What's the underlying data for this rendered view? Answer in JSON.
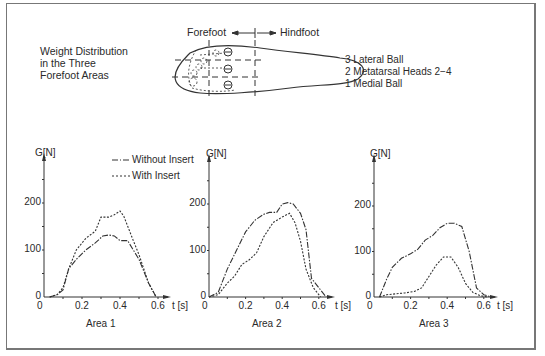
{
  "figure": {
    "title_lines": [
      "Weight Distribution",
      "in the Three",
      "Forefoot Areas"
    ],
    "forefoot_label": "Forefoot",
    "hindfoot_label": "Hindfoot",
    "areas_legend": [
      "3 Lateral Ball",
      "2 Metatarsal Heads 2−4",
      "1 Medial Ball"
    ],
    "series_legend": {
      "without": "Without Insert",
      "with": "With Insert"
    }
  },
  "chart_data": [
    {
      "type": "line",
      "title": "Area 1",
      "xlabel": "t [s]",
      "ylabel": "G[N]",
      "x_ticks": [
        "0",
        "0.2",
        "0.4",
        "0.6"
      ],
      "y_ticks": [
        "0",
        "100",
        "200"
      ],
      "xlim": [
        0,
        0.65
      ],
      "ylim": [
        0,
        280
      ],
      "series": [
        {
          "name": "Without Insert",
          "style": "dash-dot",
          "x": [
            0.03,
            0.07,
            0.1,
            0.13,
            0.17,
            0.22,
            0.27,
            0.31,
            0.34,
            0.37,
            0.4,
            0.44,
            0.47,
            0.5,
            0.55,
            0.59
          ],
          "y": [
            0,
            5,
            15,
            60,
            80,
            100,
            115,
            130,
            132,
            130,
            120,
            120,
            100,
            80,
            30,
            0
          ]
        },
        {
          "name": "With Insert",
          "style": "dashed",
          "x": [
            0.03,
            0.07,
            0.1,
            0.13,
            0.17,
            0.22,
            0.27,
            0.3,
            0.34,
            0.37,
            0.4,
            0.42,
            0.47,
            0.5,
            0.55,
            0.59
          ],
          "y": [
            0,
            5,
            20,
            60,
            100,
            125,
            140,
            170,
            170,
            175,
            183,
            172,
            120,
            90,
            30,
            0
          ]
        }
      ]
    },
    {
      "type": "line",
      "title": "Area 2",
      "xlabel": "t [s]",
      "ylabel": "G[N]",
      "x_ticks": [
        "0",
        "0.2",
        "0.4",
        "0.6"
      ],
      "y_ticks": [
        "0",
        "100",
        "200"
      ],
      "xlim": [
        0,
        0.7
      ],
      "ylim": [
        0,
        280
      ],
      "series": [
        {
          "name": "Without Insert",
          "style": "dash-dot",
          "x": [
            0,
            0.05,
            0.1,
            0.15,
            0.2,
            0.25,
            0.3,
            0.33,
            0.37,
            0.4,
            0.43,
            0.46,
            0.5,
            0.53,
            0.56,
            0.6,
            0.64
          ],
          "y": [
            0,
            10,
            60,
            100,
            140,
            165,
            178,
            182,
            182,
            200,
            203,
            200,
            180,
            145,
            40,
            20,
            0
          ]
        },
        {
          "name": "With Insert",
          "style": "dashed",
          "x": [
            0,
            0.05,
            0.1,
            0.14,
            0.18,
            0.22,
            0.26,
            0.3,
            0.35,
            0.4,
            0.44,
            0.47,
            0.5,
            0.53,
            0.57,
            0.61
          ],
          "y": [
            0,
            5,
            30,
            45,
            70,
            80,
            95,
            130,
            160,
            172,
            180,
            160,
            120,
            60,
            20,
            0
          ]
        }
      ]
    },
    {
      "type": "line",
      "title": "Area 3",
      "xlabel": "t [s]",
      "ylabel": "G[N]",
      "x_ticks": [
        "0",
        "0.2",
        "0.4",
        "0.6"
      ],
      "y_ticks": [
        "0",
        "100",
        "200"
      ],
      "xlim": [
        0,
        0.7
      ],
      "ylim": [
        0,
        280
      ],
      "series": [
        {
          "name": "Without Insert",
          "style": "dash-dot",
          "x": [
            0.03,
            0.07,
            0.1,
            0.15,
            0.2,
            0.24,
            0.28,
            0.32,
            0.36,
            0.4,
            0.44,
            0.48,
            0.52,
            0.56,
            0.6,
            0.64
          ],
          "y": [
            0,
            40,
            65,
            85,
            95,
            105,
            125,
            135,
            152,
            162,
            162,
            155,
            100,
            20,
            5,
            0
          ]
        },
        {
          "name": "With Insert",
          "style": "dashed",
          "x": [
            0.03,
            0.07,
            0.12,
            0.17,
            0.22,
            0.26,
            0.3,
            0.34,
            0.38,
            0.42,
            0.46,
            0.5,
            0.54,
            0.58,
            0.62
          ],
          "y": [
            0,
            5,
            7,
            9,
            12,
            20,
            45,
            70,
            88,
            88,
            65,
            30,
            10,
            3,
            0
          ]
        }
      ]
    }
  ]
}
